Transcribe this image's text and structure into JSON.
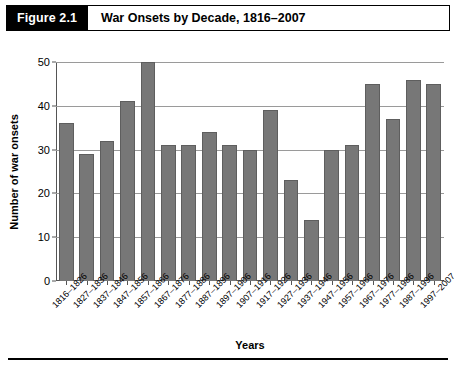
{
  "figure": {
    "number_label": "Figure 2.1",
    "title": "War Onsets by Decade, 1816–2007"
  },
  "chart_data": {
    "type": "bar",
    "title": "War Onsets by Decade, 1816–2007",
    "xlabel": "Years",
    "ylabel": "Number of war onsets",
    "ylim": [
      0,
      50
    ],
    "yticks": [
      0,
      10,
      20,
      30,
      40,
      50
    ],
    "grid": true,
    "legend": null,
    "bar_color": "#777777",
    "categories": [
      "1816–1826",
      "1827–1836",
      "1837–1846",
      "1847–1856",
      "1857–1866",
      "1867–1876",
      "1877–1886",
      "1887–1896",
      "1897–1906",
      "1907–1916",
      "1917–1926",
      "1927–1936",
      "1937–1946",
      "1947–1956",
      "1957–1966",
      "1967–1976",
      "1977–1986",
      "1987–1996",
      "1997–2007"
    ],
    "values": [
      36,
      29,
      32,
      41,
      50,
      31,
      31,
      34,
      31,
      30,
      39,
      23,
      14,
      30,
      31,
      45,
      37,
      46,
      45
    ]
  }
}
